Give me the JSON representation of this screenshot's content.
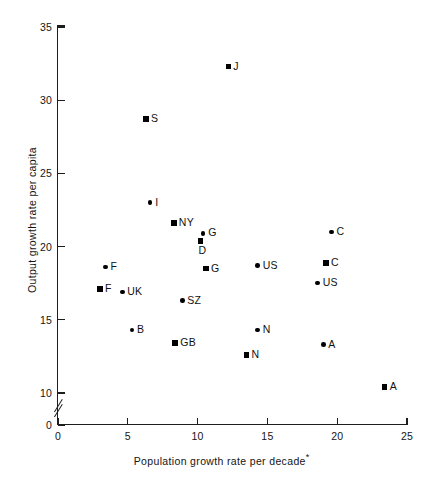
{
  "chart_data": {
    "type": "scatter",
    "title": "",
    "xlabel": "Population growth rate per decade*",
    "ylabel": "Output growth rate per capita",
    "xlim": [
      0,
      25
    ],
    "ylim": [
      0,
      35
    ],
    "grid": false,
    "legend": "none",
    "axis_break_y": true,
    "y_break_between": [
      0,
      10
    ],
    "xticks": [
      "0",
      "5",
      "10",
      "15",
      "20",
      "25"
    ],
    "yticks": [
      "0",
      "10",
      "15",
      "20",
      "25",
      "30",
      "35"
    ],
    "marker_note": "square = one period/series, circle = other period/series",
    "points": [
      {
        "label": "J",
        "x": 12.2,
        "y": 32.3,
        "marker": "square",
        "label_pos": "right"
      },
      {
        "label": "S",
        "x": 6.3,
        "y": 28.7,
        "marker": "square",
        "label_pos": "right"
      },
      {
        "label": "I",
        "x": 6.6,
        "y": 23.0,
        "marker": "circle",
        "label_pos": "right"
      },
      {
        "label": "NY",
        "x": 8.3,
        "y": 21.6,
        "marker": "square",
        "label_pos": "right"
      },
      {
        "label": "G",
        "x": 10.4,
        "y": 20.9,
        "marker": "circle",
        "label_pos": "right"
      },
      {
        "label": "D",
        "x": 10.2,
        "y": 20.4,
        "marker": "square",
        "label_pos": "below"
      },
      {
        "label": "C",
        "x": 19.6,
        "y": 21.0,
        "marker": "circle",
        "label_pos": "right"
      },
      {
        "label": "F",
        "x": 3.4,
        "y": 18.6,
        "marker": "circle",
        "label_pos": "right"
      },
      {
        "label": "G",
        "x": 10.6,
        "y": 18.5,
        "marker": "square",
        "label_pos": "right"
      },
      {
        "label": "US",
        "x": 14.3,
        "y": 18.7,
        "marker": "circle",
        "label_pos": "right"
      },
      {
        "label": "C",
        "x": 19.2,
        "y": 18.9,
        "marker": "square",
        "label_pos": "right"
      },
      {
        "label": "F",
        "x": 3.0,
        "y": 17.1,
        "marker": "square",
        "label_pos": "right"
      },
      {
        "label": "UK",
        "x": 4.6,
        "y": 16.9,
        "marker": "circle",
        "label_pos": "right"
      },
      {
        "label": "US",
        "x": 18.6,
        "y": 17.5,
        "marker": "circle",
        "label_pos": "right"
      },
      {
        "label": "SZ",
        "x": 8.9,
        "y": 16.3,
        "marker": "circle",
        "label_pos": "right"
      },
      {
        "label": "B",
        "x": 5.3,
        "y": 14.3,
        "marker": "circle",
        "label_pos": "right"
      },
      {
        "label": "N",
        "x": 14.3,
        "y": 14.3,
        "marker": "circle",
        "label_pos": "right"
      },
      {
        "label": "A",
        "x": 19.0,
        "y": 13.3,
        "marker": "circle",
        "label_pos": "right"
      },
      {
        "label": "GB",
        "x": 8.4,
        "y": 13.4,
        "marker": "square",
        "label_pos": "right"
      },
      {
        "label": "N",
        "x": 13.5,
        "y": 12.6,
        "marker": "square",
        "label_pos": "right"
      },
      {
        "label": "A",
        "x": 23.4,
        "y": 10.4,
        "marker": "square",
        "label_pos": "right"
      }
    ]
  }
}
